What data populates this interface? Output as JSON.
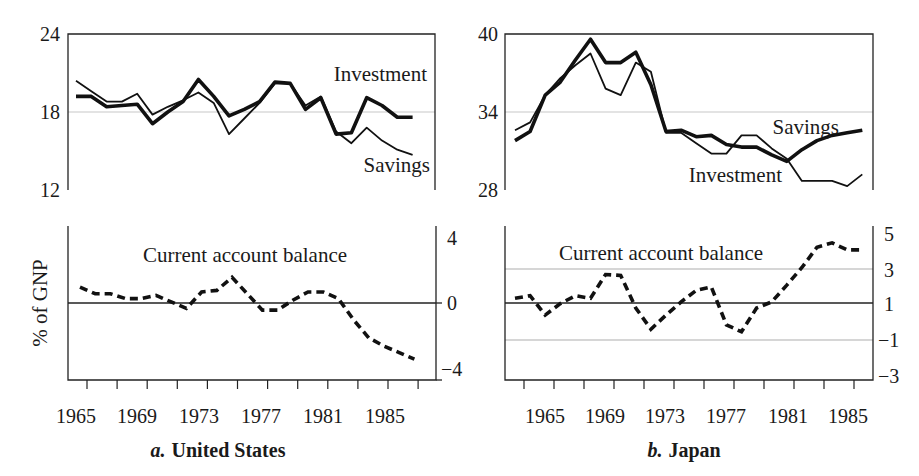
{
  "chart_data": [
    {
      "id": "us_top",
      "panel": "a",
      "country": "United States",
      "type": "line",
      "title": "",
      "xlabel": "",
      "ylabel": "% of GNP",
      "ylim": [
        12,
        24
      ],
      "yticks": [
        12,
        18,
        24
      ],
      "yaxis_side": "left",
      "reference_lines": [
        {
          "y": 18,
          "style": "gray"
        }
      ],
      "x": [
        1965,
        1966,
        1967,
        1968,
        1969,
        1970,
        1971,
        1972,
        1973,
        1974,
        1975,
        1976,
        1977,
        1978,
        1979,
        1980,
        1981,
        1982,
        1983,
        1984,
        1985,
        1986,
        1987
      ],
      "series": [
        {
          "name": "Investment",
          "style": "thick",
          "values": [
            19.2,
            19.2,
            18.4,
            18.5,
            18.6,
            17.1,
            18.0,
            18.8,
            20.5,
            19.2,
            17.7,
            18.2,
            18.8,
            20.3,
            20.2,
            18.2,
            19.1,
            16.3,
            16.4,
            19.1,
            18.5,
            17.6,
            17.6
          ]
        },
        {
          "name": "Savings",
          "style": "thin",
          "values": [
            20.4,
            19.6,
            18.8,
            18.8,
            19.4,
            17.8,
            18.4,
            18.9,
            19.5,
            18.7,
            16.3,
            17.5,
            18.7,
            20.2,
            20.2,
            18.5,
            19.2,
            16.5,
            15.6,
            16.8,
            15.8,
            15.1,
            14.7
          ]
        }
      ],
      "annotations": [
        {
          "text": "Investment"
        },
        {
          "text": "Savings"
        }
      ]
    },
    {
      "id": "us_bottom",
      "panel": "a",
      "country": "United States",
      "type": "line",
      "ylim": [
        -4,
        4
      ],
      "yticks": [
        -4,
        0,
        4
      ],
      "yaxis_side": "right",
      "reference_lines": [
        {
          "y": 0,
          "style": "solid"
        }
      ],
      "x": [
        1965,
        1966,
        1967,
        1968,
        1969,
        1970,
        1971,
        1972,
        1973,
        1974,
        1975,
        1976,
        1977,
        1978,
        1979,
        1980,
        1981,
        1982,
        1983,
        1984,
        1985,
        1986,
        1987
      ],
      "series": [
        {
          "name": "Current account balance",
          "style": "dashed",
          "values": [
            1.0,
            0.6,
            0.6,
            0.3,
            0.3,
            0.5,
            0.1,
            -0.3,
            0.7,
            0.8,
            1.6,
            0.6,
            -0.4,
            -0.4,
            0.2,
            0.7,
            0.7,
            0.3,
            -1.0,
            -2.1,
            -2.6,
            -3.0,
            -3.4
          ]
        }
      ],
      "annotations": [
        {
          "text": "Current account balance"
        }
      ]
    },
    {
      "id": "jp_top",
      "panel": "b",
      "country": "Japan",
      "type": "line",
      "ylim": [
        28,
        40
      ],
      "yticks": [
        28,
        34,
        40
      ],
      "yaxis_side": "left",
      "reference_lines": [
        {
          "y": 34,
          "style": "gray"
        }
      ],
      "x": [
        1963,
        1964,
        1965,
        1966,
        1967,
        1968,
        1969,
        1970,
        1971,
        1972,
        1973,
        1974,
        1975,
        1976,
        1977,
        1978,
        1979,
        1980,
        1981,
        1982,
        1983,
        1984,
        1985,
        1986
      ],
      "series": [
        {
          "name": "Savings",
          "style": "thick",
          "values": [
            31.8,
            32.5,
            35.3,
            36.3,
            38.0,
            39.6,
            37.8,
            37.8,
            38.6,
            36.1,
            32.5,
            32.6,
            32.1,
            32.2,
            31.5,
            31.3,
            31.3,
            30.7,
            30.2,
            31.1,
            31.8,
            32.2,
            32.4,
            32.6
          ]
        },
        {
          "name": "Investment",
          "style": "thin",
          "values": [
            32.6,
            33.2,
            35.3,
            36.6,
            37.6,
            38.5,
            35.8,
            35.3,
            37.8,
            37.1,
            32.4,
            32.4,
            31.6,
            30.8,
            30.8,
            32.2,
            32.2,
            31.2,
            30.4,
            28.7,
            28.7,
            28.7,
            28.3,
            29.2
          ]
        }
      ],
      "annotations": [
        {
          "text": "Savings"
        },
        {
          "text": "Investment"
        }
      ]
    },
    {
      "id": "jp_bottom",
      "panel": "b",
      "country": "Japan",
      "type": "line",
      "ylim": [
        -3,
        5
      ],
      "yticks": [
        -3,
        -1,
        1,
        3,
        5
      ],
      "yaxis_side": "right",
      "reference_lines": [
        {
          "y": 1,
          "style": "solid"
        },
        {
          "y": 3,
          "style": "gray"
        },
        {
          "y": -1,
          "style": "gray"
        }
      ],
      "x": [
        1963,
        1964,
        1965,
        1966,
        1967,
        1968,
        1969,
        1970,
        1971,
        1972,
        1973,
        1974,
        1975,
        1976,
        1977,
        1978,
        1979,
        1980,
        1981,
        1982,
        1983,
        1984,
        1985,
        1986
      ],
      "series": [
        {
          "name": "Current account balance",
          "style": "dashed",
          "values": [
            1.35,
            1.5,
            0.4,
            1.05,
            1.5,
            1.35,
            2.7,
            2.65,
            0.8,
            -0.4,
            0.4,
            1.15,
            1.8,
            2.0,
            -0.15,
            -0.55,
            0.8,
            1.15,
            2.1,
            3.1,
            4.25,
            4.5,
            4.1,
            4.1
          ]
        }
      ],
      "annotations": [
        {
          "text": "Current account balance"
        }
      ]
    }
  ],
  "figure": {
    "shared_ylabel": "% of GNP",
    "xtick_labels": [
      "1965",
      "1969",
      "1973",
      "1977",
      "1981",
      "1985"
    ],
    "panel_a": {
      "letter": "a.",
      "title": "United States"
    },
    "panel_b": {
      "letter": "b.",
      "title": "Japan"
    },
    "us_top_labels": {
      "investment": "Investment",
      "savings": "Savings",
      "y24": "24",
      "y18": "18",
      "y12": "12"
    },
    "us_bottom_labels": {
      "cab": "Current account balance",
      "y4": "4",
      "y0": "0",
      "yn4": "−4"
    },
    "jp_top_labels": {
      "savings": "Savings",
      "investment": "Investment",
      "y40": "40",
      "y34": "34",
      "y28": "28"
    },
    "jp_bottom_labels": {
      "cab": "Current account balance",
      "y5": "5",
      "y3": "3",
      "y1": "1",
      "yn1": "−1",
      "yn3": "−3"
    }
  }
}
